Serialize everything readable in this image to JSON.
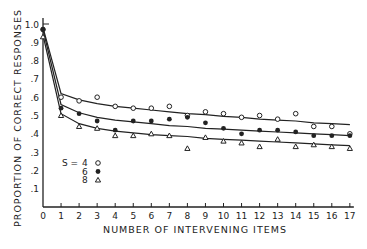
{
  "chart_data": {
    "type": "line",
    "title": "",
    "xlabel": "NUMBER OF INTERVENING ITEMS",
    "ylabel": "PROPORTION OF CORRECT RESPONSES",
    "x": [
      0,
      1,
      2,
      3,
      4,
      5,
      6,
      7,
      8,
      9,
      10,
      11,
      12,
      13,
      14,
      15,
      16,
      17
    ],
    "x_ticks": [
      "0",
      "1",
      "2",
      "3",
      "4",
      "5",
      "6",
      "7",
      "8",
      "9",
      "10",
      "11",
      "12",
      "13",
      "14",
      "15",
      "16",
      "17"
    ],
    "y_ticks": [
      ".1",
      ".2",
      ".3",
      ".4",
      ".5",
      ".6",
      ".7",
      ".8",
      ".9",
      "1.0"
    ],
    "xlim": [
      0,
      17
    ],
    "ylim": [
      0,
      1.0
    ],
    "grid": false,
    "legend": {
      "position": "lower-left",
      "title": "S =",
      "entries": [
        {
          "label": "4",
          "marker": "open-circle"
        },
        {
          "label": "6",
          "marker": "filled-circle"
        },
        {
          "label": "8",
          "marker": "open-triangle"
        }
      ]
    },
    "series": [
      {
        "name": "S=4",
        "marker": "open-circle",
        "values": [
          0.97,
          0.6,
          0.58,
          0.6,
          0.55,
          0.54,
          0.54,
          0.55,
          0.5,
          0.52,
          0.51,
          0.49,
          0.5,
          0.48,
          0.51,
          0.44,
          0.44,
          0.4
        ],
        "fit": [
          0.98,
          0.62,
          0.585,
          0.565,
          0.55,
          0.54,
          0.53,
          0.52,
          0.51,
          0.505,
          0.495,
          0.49,
          0.48,
          0.475,
          0.47,
          0.46,
          0.455,
          0.45
        ]
      },
      {
        "name": "S=6",
        "marker": "filled-circle",
        "values": [
          0.97,
          0.54,
          0.51,
          0.47,
          0.42,
          0.47,
          0.47,
          0.48,
          0.49,
          0.46,
          0.43,
          0.4,
          0.42,
          0.42,
          0.41,
          0.39,
          0.39,
          0.39
        ],
        "fit": [
          0.97,
          0.56,
          0.515,
          0.49,
          0.475,
          0.465,
          0.455,
          0.445,
          0.44,
          0.43,
          0.425,
          0.42,
          0.415,
          0.41,
          0.405,
          0.4,
          0.395,
          0.39
        ]
      },
      {
        "name": "S=8",
        "marker": "open-triangle",
        "values": [
          0.93,
          0.5,
          0.44,
          0.43,
          0.39,
          0.39,
          0.4,
          0.39,
          0.32,
          0.38,
          0.36,
          0.35,
          0.33,
          0.37,
          0.33,
          0.34,
          0.33,
          0.32
        ],
        "fit": [
          0.94,
          0.51,
          0.455,
          0.43,
          0.415,
          0.405,
          0.395,
          0.39,
          0.385,
          0.375,
          0.37,
          0.365,
          0.36,
          0.355,
          0.35,
          0.345,
          0.34,
          0.335
        ]
      }
    ]
  }
}
